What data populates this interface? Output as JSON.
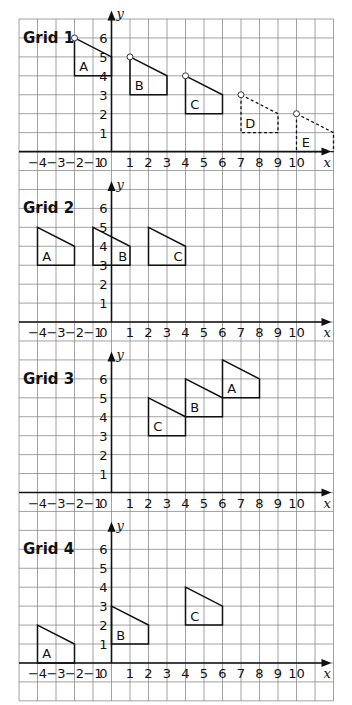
{
  "layout": {
    "left": 19,
    "top": 19,
    "cols": 17,
    "rows": 36,
    "cell_w": 18.5,
    "cell_h": 18.94,
    "x_min": -5,
    "x_max": 12,
    "grid_color": "#8a8a8a",
    "axis_color": "#111111",
    "shape_color": "#111111"
  },
  "grids": [
    {
      "title": "Grid 1",
      "origin_row": 7,
      "x_ticks": [
        "-4",
        "-3",
        "-2",
        "-1",
        "0",
        "1",
        "2",
        "3",
        "4",
        "5",
        "6",
        "7",
        "8",
        "9",
        "10"
      ],
      "y_ticks": [
        "1",
        "2",
        "3",
        "4",
        "5",
        "6"
      ],
      "x_label": "x",
      "y_label": "y",
      "shapes": [
        {
          "label": "A",
          "points": [
            [
              -2,
              6
            ],
            [
              0,
              5
            ],
            [
              0,
              4
            ],
            [
              -2,
              4
            ]
          ],
          "style": "solid",
          "marker": [
            -2,
            6
          ],
          "label_at": [
            -1.5,
            4.5
          ]
        },
        {
          "label": "B",
          "points": [
            [
              1,
              5
            ],
            [
              3,
              4
            ],
            [
              3,
              3
            ],
            [
              1,
              3
            ]
          ],
          "style": "solid",
          "marker": [
            1,
            5
          ],
          "label_at": [
            1.5,
            3.5
          ]
        },
        {
          "label": "C",
          "points": [
            [
              4,
              4
            ],
            [
              6,
              3
            ],
            [
              6,
              2
            ],
            [
              4,
              2
            ]
          ],
          "style": "solid",
          "marker": [
            4,
            4
          ],
          "label_at": [
            4.5,
            2.5
          ]
        },
        {
          "label": "D",
          "points": [
            [
              7,
              3
            ],
            [
              9,
              2
            ],
            [
              9,
              1
            ],
            [
              7,
              1
            ]
          ],
          "style": "dashed",
          "marker": [
            7,
            3
          ],
          "label_at": [
            7.5,
            1.5
          ]
        },
        {
          "label": "E",
          "points": [
            [
              10,
              2
            ],
            [
              12,
              1
            ],
            [
              12,
              0
            ],
            [
              10,
              0
            ]
          ],
          "style": "dashed",
          "marker": [
            10,
            2
          ],
          "label_at": [
            10.5,
            0.5
          ]
        }
      ]
    },
    {
      "title": "Grid 2",
      "origin_row": 16,
      "x_ticks": [
        "-4",
        "-3",
        "-2",
        "-1",
        "0",
        "1",
        "2",
        "3",
        "4",
        "5",
        "6",
        "7",
        "8",
        "9",
        "10"
      ],
      "y_ticks": [
        "1",
        "2",
        "3",
        "4",
        "5",
        "6"
      ],
      "x_label": "x",
      "y_label": "y",
      "shapes": [
        {
          "label": "A",
          "points": [
            [
              -4,
              5
            ],
            [
              -2,
              4
            ],
            [
              -2,
              3
            ],
            [
              -4,
              3
            ]
          ],
          "style": "solid",
          "label_at": [
            -3.5,
            3.5
          ]
        },
        {
          "label": "B",
          "points": [
            [
              -1,
              5
            ],
            [
              1,
              4
            ],
            [
              1,
              3
            ],
            [
              -1,
              3
            ]
          ],
          "style": "solid",
          "label_at": [
            0.6,
            3.5
          ]
        },
        {
          "label": "C",
          "points": [
            [
              2,
              5
            ],
            [
              4,
              4
            ],
            [
              4,
              3
            ],
            [
              2,
              3
            ]
          ],
          "style": "solid",
          "label_at": [
            3.6,
            3.5
          ]
        }
      ]
    },
    {
      "title": "Grid 3",
      "origin_row": 25,
      "x_ticks": [
        "-4",
        "-3",
        "-2",
        "-1",
        "0",
        "1",
        "2",
        "3",
        "4",
        "5",
        "6",
        "7",
        "8",
        "9",
        "10"
      ],
      "y_ticks": [
        "1",
        "2",
        "3",
        "4",
        "5",
        "6"
      ],
      "x_label": "x",
      "y_label": "y",
      "shapes": [
        {
          "label": "A",
          "points": [
            [
              6,
              7
            ],
            [
              8,
              6
            ],
            [
              8,
              5
            ],
            [
              6,
              5
            ]
          ],
          "style": "solid",
          "label_at": [
            6.5,
            5.5
          ]
        },
        {
          "label": "B",
          "points": [
            [
              4,
              6
            ],
            [
              6,
              5
            ],
            [
              6,
              4
            ],
            [
              4,
              4
            ]
          ],
          "style": "solid",
          "label_at": [
            4.5,
            4.5
          ]
        },
        {
          "label": "C",
          "points": [
            [
              2,
              5
            ],
            [
              4,
              4
            ],
            [
              4,
              3
            ],
            [
              2,
              3
            ]
          ],
          "style": "solid",
          "label_at": [
            2.5,
            3.5
          ]
        }
      ]
    },
    {
      "title": "Grid 4",
      "origin_row": 34,
      "x_ticks": [
        "-4",
        "-3",
        "-2",
        "-1",
        "0",
        "1",
        "2",
        "3",
        "4",
        "5",
        "6",
        "7",
        "8",
        "9",
        "10"
      ],
      "y_ticks": [
        "1",
        "2",
        "3",
        "4",
        "5",
        "6"
      ],
      "x_label": "x",
      "y_label": "y",
      "shapes": [
        {
          "label": "A",
          "points": [
            [
              -4,
              2
            ],
            [
              -2,
              1
            ],
            [
              -2,
              0
            ],
            [
              -4,
              0
            ]
          ],
          "style": "solid",
          "label_at": [
            -3.5,
            0.5
          ]
        },
        {
          "label": "B",
          "points": [
            [
              0,
              3
            ],
            [
              2,
              2
            ],
            [
              2,
              1
            ],
            [
              0,
              1
            ]
          ],
          "style": "solid",
          "label_at": [
            0.5,
            1.5
          ]
        },
        {
          "label": "C",
          "points": [
            [
              4,
              4
            ],
            [
              6,
              3
            ],
            [
              6,
              2
            ],
            [
              4,
              2
            ]
          ],
          "style": "solid",
          "label_at": [
            4.5,
            2.5
          ]
        }
      ]
    }
  ]
}
